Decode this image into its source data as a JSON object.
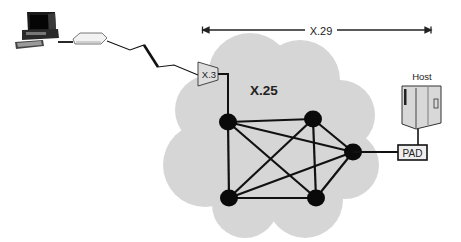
{
  "diagram": {
    "type": "network-topology",
    "labels": {
      "x29": "X.29",
      "x25": "X.25",
      "x3": "X.3",
      "pad": "PAD",
      "host": "Host"
    },
    "colors": {
      "cloud": "#d6d6d6",
      "line": "#111111",
      "node": "#0a0a0a",
      "device_fill": "#e4e4e4"
    },
    "nodes": [
      {
        "id": "n1",
        "x": 228,
        "y": 122
      },
      {
        "id": "n2",
        "x": 313,
        "y": 119
      },
      {
        "id": "n3",
        "x": 353,
        "y": 152
      },
      {
        "id": "n4",
        "x": 229,
        "y": 198
      },
      {
        "id": "n5",
        "x": 316,
        "y": 198
      }
    ],
    "edges": [
      [
        "n1",
        "n2"
      ],
      [
        "n1",
        "n3"
      ],
      [
        "n1",
        "n4"
      ],
      [
        "n1",
        "n5"
      ],
      [
        "n2",
        "n3"
      ],
      [
        "n2",
        "n4"
      ],
      [
        "n2",
        "n5"
      ],
      [
        "n3",
        "n4"
      ],
      [
        "n3",
        "n5"
      ],
      [
        "n4",
        "n5"
      ]
    ],
    "devices": [
      "terminal",
      "modem",
      "x3-pad",
      "pad",
      "host"
    ]
  }
}
